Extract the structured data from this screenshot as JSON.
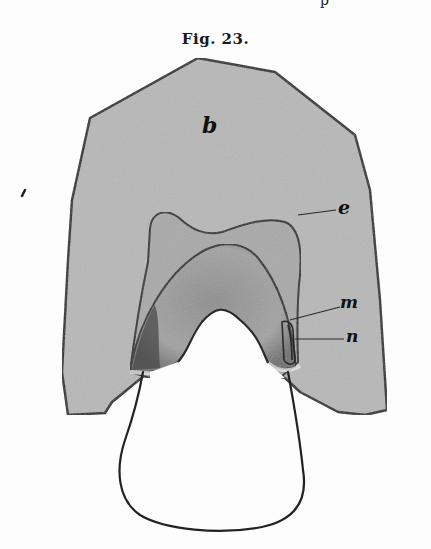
{
  "page": {
    "caption": "Fig. 23.",
    "top_cut_glyph": "p"
  },
  "figure": {
    "labels": {
      "b": "b",
      "e": "e",
      "m": "m",
      "n": "n"
    },
    "colors": {
      "shade": "#b9b9b9",
      "inner_shade": "#a8a8a8",
      "arch_shade": "#9a9a9a",
      "outline": "#2a2a2a",
      "paper": "#fdfdfd"
    }
  }
}
